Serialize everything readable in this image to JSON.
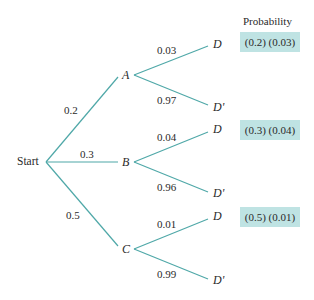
{
  "diagram": {
    "type": "probability-tree",
    "root": "Start",
    "header": "Probability",
    "colors": {
      "edge": "#4fa8a8",
      "highlight_box": "#bfe3e3",
      "text": "#2a2a2a"
    },
    "first_level": [
      {
        "node": "A",
        "prob": "0.2"
      },
      {
        "node": "B",
        "prob": "0.3"
      },
      {
        "node": "C",
        "prob": "0.5"
      }
    ],
    "second_level": {
      "A": [
        {
          "node": "D",
          "prob": "0.03"
        },
        {
          "node": "D'",
          "prob": "0.97"
        }
      ],
      "B": [
        {
          "node": "D",
          "prob": "0.04"
        },
        {
          "node": "D'",
          "prob": "0.96"
        }
      ],
      "C": [
        {
          "node": "D",
          "prob": "0.01"
        },
        {
          "node": "D'",
          "prob": "0.99"
        }
      ]
    },
    "joint_probabilities": [
      {
        "path": "A-D",
        "label": "(0.2) (0.03)"
      },
      {
        "path": "B-D",
        "label": "(0.3) (0.04)"
      },
      {
        "path": "C-D",
        "label": "(0.5) (0.01)"
      }
    ]
  }
}
